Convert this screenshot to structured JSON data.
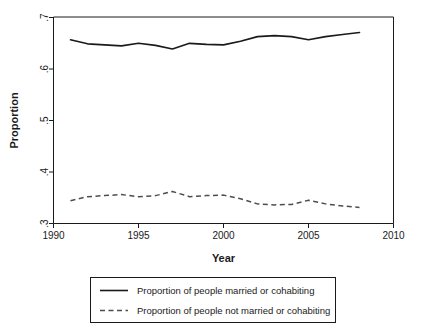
{
  "chart_data": {
    "type": "line",
    "title": "",
    "xlabel": "Year",
    "ylabel": "Proportion",
    "xlim": [
      1990,
      2010
    ],
    "ylim": [
      0.3,
      0.7
    ],
    "grid": false,
    "legend_position": "bottom",
    "xticks": [
      "1990",
      "1995",
      "2000",
      "2005",
      "2010"
    ],
    "xtick_values": [
      1990,
      1995,
      2000,
      2005,
      2010
    ],
    "yticks": [
      ".3",
      ".4",
      ".5",
      ".6",
      ".7"
    ],
    "ytick_values": [
      0.3,
      0.4,
      0.5,
      0.6,
      0.7
    ],
    "x": [
      1991,
      1992,
      1993,
      1994,
      1995,
      1996,
      1997,
      1998,
      1999,
      2000,
      2001,
      2002,
      2003,
      2004,
      2005,
      2006,
      2007,
      2008
    ],
    "series": [
      {
        "name": "Proportion of people married or cohabiting",
        "style": "solid",
        "color": "#1a1a1a",
        "values": [
          0.656,
          0.648,
          0.646,
          0.644,
          0.649,
          0.645,
          0.638,
          0.649,
          0.647,
          0.646,
          0.653,
          0.662,
          0.664,
          0.662,
          0.656,
          0.662,
          0.666,
          0.67
        ]
      },
      {
        "name": "Proportion of people not married or cohabiting",
        "style": "dashed",
        "color": "#4d4d4d",
        "values": [
          0.344,
          0.352,
          0.354,
          0.356,
          0.352,
          0.354,
          0.362,
          0.352,
          0.354,
          0.355,
          0.348,
          0.338,
          0.336,
          0.337,
          0.345,
          0.338,
          0.334,
          0.331
        ]
      }
    ]
  },
  "axes": {
    "y_title": "Proportion",
    "x_title": "Year"
  },
  "legend": {
    "entries": [
      {
        "label": "Proportion of people married or cohabiting",
        "style": "solid"
      },
      {
        "label": "Proportion of people not married or cohabiting",
        "style": "dashed"
      }
    ]
  }
}
